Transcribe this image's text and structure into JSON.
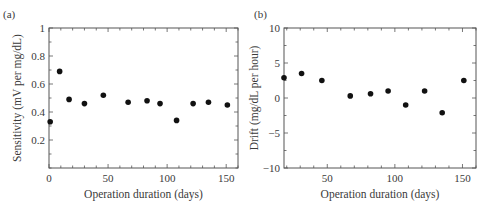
{
  "chart_data": [
    {
      "panel": "(a)",
      "type": "scatter",
      "title": "",
      "xlabel": "Operation duration (days)",
      "ylabel": "Sensitivity (mV per mg/dL)",
      "xlim": [
        0,
        160
      ],
      "ylim": [
        0,
        1
      ],
      "xticks": [
        0,
        50,
        100,
        150
      ],
      "xtick_labels": [
        "0",
        "50",
        "100",
        "150"
      ],
      "x_minor_step": 10,
      "yticks": [
        0.2,
        0.4,
        0.6,
        0.8,
        1
      ],
      "ytick_labels": [
        "0.2",
        "0.4",
        "0.6",
        "0.8",
        "1"
      ],
      "y_minor_step": 0.1,
      "grid": false,
      "legend": null,
      "x": [
        1,
        9,
        17,
        30,
        46,
        67,
        83,
        94,
        108,
        122,
        135,
        151
      ],
      "y": [
        0.33,
        0.69,
        0.49,
        0.46,
        0.52,
        0.47,
        0.48,
        0.46,
        0.34,
        0.46,
        0.47,
        0.45
      ]
    },
    {
      "panel": "(b)",
      "type": "scatter",
      "title": "",
      "xlabel": "Operation duration (days)",
      "ylabel": "Drift (mg/dL per hour)",
      "xlim": [
        18,
        160
      ],
      "ylim": [
        -10,
        10
      ],
      "xticks": [
        50,
        100,
        150
      ],
      "xtick_labels": [
        "50",
        "100",
        "150"
      ],
      "x_minor_step": 10,
      "yticks": [
        -10,
        -5,
        0,
        5,
        10
      ],
      "ytick_labels": [
        "−10",
        "−5",
        "0",
        "5",
        "10"
      ],
      "y_minor_step": 2.5,
      "grid": false,
      "legend": null,
      "x": [
        18,
        31,
        46,
        67,
        82,
        95,
        108,
        122,
        135,
        151
      ],
      "y": [
        2.9,
        3.5,
        2.5,
        0.3,
        0.6,
        1.0,
        -1.0,
        1.0,
        -2.1,
        2.5
      ]
    }
  ],
  "style": {
    "axis_color": "#555555",
    "marker_color": "#111111",
    "text_color": "#3a3a3a"
  },
  "layout": {
    "panels": [
      {
        "left": 49,
        "top": 28,
        "right": 238,
        "bottom": 168
      },
      {
        "left": 284,
        "top": 28,
        "right": 476,
        "bottom": 168
      }
    ]
  }
}
